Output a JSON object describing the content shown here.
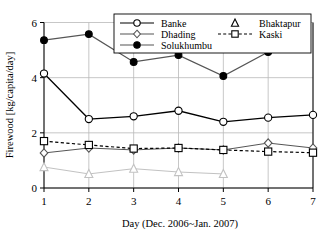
{
  "chart_data": {
    "type": "line",
    "title": "",
    "xlabel": "Day (Dec. 2006~Jan. 2007)",
    "ylabel": "Firewood [kg/capita/day]",
    "x": [
      1,
      2,
      3,
      4,
      5,
      6,
      7
    ],
    "xticklabels": [
      "1",
      "2",
      "3",
      "4",
      "5",
      "6",
      "7"
    ],
    "yticklabels": [
      "0",
      "2",
      "4",
      "6"
    ],
    "yticks": [
      0,
      2,
      4,
      6
    ],
    "xlim": [
      1,
      7
    ],
    "ylim": [
      0,
      6
    ],
    "grid": true,
    "legend_position": "top-center",
    "series": [
      {
        "name": "Banke",
        "marker": "open-circle",
        "linestyle": "solid",
        "color": "#000000",
        "values": [
          4.15,
          2.5,
          2.6,
          2.8,
          2.4,
          2.55,
          2.65
        ]
      },
      {
        "name": "Dhading",
        "marker": "open-diamond",
        "linestyle": "solid",
        "color": "#555555",
        "values": [
          1.27,
          1.45,
          1.38,
          1.45,
          1.38,
          1.63,
          1.45
        ]
      },
      {
        "name": "Solukhumbu",
        "marker": "filled-circle",
        "linestyle": "solid",
        "color": "#555555",
        "values": [
          5.36,
          5.58,
          4.57,
          4.82,
          4.06,
          4.93,
          null
        ]
      },
      {
        "name": "Bhaktapur",
        "marker": "open-triangle",
        "linestyle": "solid",
        "color": "#c2c2c2",
        "values": [
          0.76,
          0.51,
          0.7,
          0.58,
          0.51,
          null,
          null
        ]
      },
      {
        "name": "Kaski",
        "marker": "open-square",
        "linestyle": "dashed",
        "color": "#000000",
        "values": [
          1.7,
          1.56,
          1.43,
          1.45,
          1.38,
          1.32,
          1.28
        ]
      }
    ]
  },
  "legend": {
    "entries": [
      {
        "label": "Banke"
      },
      {
        "label": "Bhaktapur"
      },
      {
        "label": "Dhading"
      },
      {
        "label": "Kaski"
      },
      {
        "label": "Solukhumbu"
      }
    ]
  },
  "axes": {
    "y_title": "Firewood [kg/capita/day]",
    "x_title": "Day (Dec. 2006~Jan. 2007)"
  }
}
